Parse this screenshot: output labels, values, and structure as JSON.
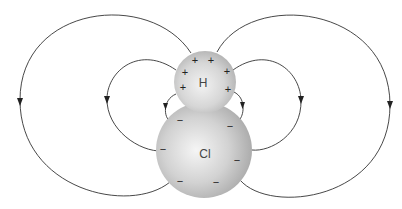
{
  "diagram": {
    "atoms": [
      {
        "id": "H",
        "label": "H",
        "charge_sign": "+",
        "cx": 205,
        "cy": 82,
        "r": 31
      },
      {
        "id": "Cl",
        "label": "Cl",
        "charge_sign": "−",
        "cx": 204,
        "cy": 150,
        "r": 48
      }
    ],
    "h_signs": [
      "+",
      "+",
      "+",
      "+",
      "+",
      "+",
      "+",
      "+"
    ],
    "cl_signs": [
      "−",
      "−",
      "−",
      "−",
      "−",
      "−",
      "−",
      "−"
    ],
    "field_line_color": "#333333",
    "sphere_highlight": "#f4f4f4",
    "sphere_shadow": "#a8a8a8"
  }
}
